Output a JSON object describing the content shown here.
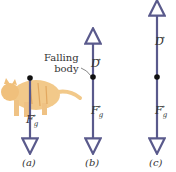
{
  "annotation": {
    "line1": "Falling",
    "line2": "body"
  },
  "panels": [
    {
      "caption": "(a)",
      "forces": [
        "F_g"
      ],
      "fg_label": "F",
      "fg_sub": "g"
    },
    {
      "caption": "(b)",
      "forces": [
        "D",
        "F_g"
      ],
      "d_label": "D",
      "fg_label": "F",
      "fg_sub": "g"
    },
    {
      "caption": "(c)",
      "forces": [
        "D",
        "F_g"
      ],
      "d_label": "D",
      "fg_label": "F",
      "fg_sub": "g"
    }
  ],
  "colors": {
    "vector": "#5a5a8c",
    "cat": "#f2c98a",
    "dot": "#111111"
  }
}
